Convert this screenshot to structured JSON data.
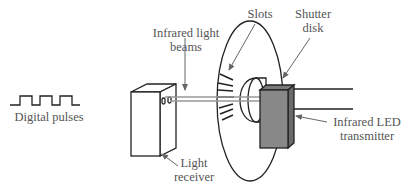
{
  "diagram": {
    "labels": {
      "beams_line1": "Infrared light",
      "beams_line2": "beams",
      "slots": "Slots",
      "shutter_line1": "Shutter",
      "shutter_line2": "disk",
      "pulses": "Digital pulses",
      "receiver_line1": "Light",
      "receiver_line2": "receiver",
      "transmitter_line1": "Infrared LED",
      "transmitter_line2": "transmitter"
    },
    "colors": {
      "line": "#222222",
      "text": "#555555",
      "arrow": "#666666",
      "transmitter_front": "#888888",
      "transmitter_side": "#6a6a6a",
      "beam": "#999999"
    }
  }
}
